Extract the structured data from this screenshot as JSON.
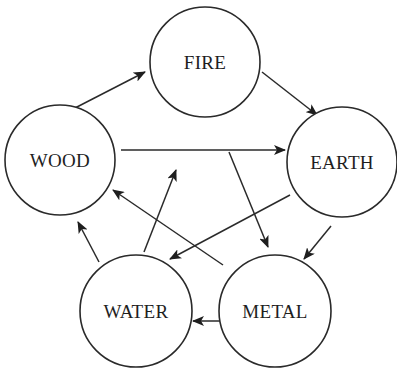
{
  "diagram": {
    "title": "",
    "type": "cycle",
    "colors": {
      "stroke": "#2a2a2a",
      "text": "#1e1e1e",
      "background": "#ffffff"
    },
    "nodes": [
      {
        "id": "fire",
        "label": "FIRE",
        "cx": 205,
        "cy": 62,
        "r": 55
      },
      {
        "id": "wood",
        "label": "WOOD",
        "cx": 60,
        "cy": 160,
        "r": 55
      },
      {
        "id": "earth",
        "label": "EARTH",
        "cx": 342,
        "cy": 162,
        "r": 55
      },
      {
        "id": "water",
        "label": "WATER",
        "cx": 136,
        "cy": 311,
        "r": 56
      },
      {
        "id": "metal",
        "label": "METAL",
        "cx": 275,
        "cy": 311,
        "r": 56
      }
    ],
    "edges": [
      {
        "from": "wood",
        "to": "fire",
        "x1": 75,
        "y1": 108,
        "x2": 145,
        "y2": 72
      },
      {
        "from": "fire",
        "to": "earth",
        "x1": 262,
        "y1": 72,
        "x2": 317,
        "y2": 115
      },
      {
        "from": "wood",
        "to": "earth",
        "x1": 121,
        "y1": 150,
        "x2": 285,
        "y2": 150
      },
      {
        "from": "water",
        "to": "fire",
        "x1": 144,
        "y1": 252,
        "x2": 176,
        "y2": 170
      },
      {
        "from": "fire",
        "to": "metal",
        "x1": 229,
        "y1": 152,
        "x2": 268,
        "y2": 247
      },
      {
        "from": "earth",
        "to": "water",
        "x1": 290,
        "y1": 195,
        "x2": 170,
        "y2": 259
      },
      {
        "from": "metal",
        "to": "wood",
        "x1": 223,
        "y1": 265,
        "x2": 113,
        "y2": 190
      },
      {
        "from": "earth",
        "to": "metal",
        "x1": 331,
        "y1": 226,
        "x2": 304,
        "y2": 259
      },
      {
        "from": "metal",
        "to": "water",
        "x1": 220,
        "y1": 321,
        "x2": 193,
        "y2": 321
      },
      {
        "from": "water",
        "to": "wood",
        "x1": 99,
        "y1": 262,
        "x2": 78,
        "y2": 222
      }
    ]
  }
}
